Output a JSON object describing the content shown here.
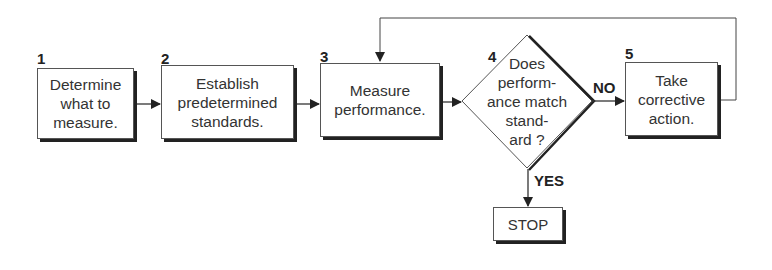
{
  "diagram": {
    "type": "flowchart",
    "steps": [
      {
        "number": "1",
        "text": "Determine what to measure.",
        "lines": [
          "Determine",
          "what to",
          "measure."
        ]
      },
      {
        "number": "2",
        "text": "Establish predetermined standards.",
        "lines": [
          "Establish",
          "predetermined",
          "standards."
        ]
      },
      {
        "number": "3",
        "text": "Measure performance.",
        "lines": [
          "Measure",
          "performance."
        ]
      },
      {
        "number": "4",
        "text": "Does performance match standard?",
        "lines": [
          "Does",
          "perform-",
          "ance match",
          "stand-",
          "ard ?"
        ]
      },
      {
        "number": "5",
        "text": "Take corrective action.",
        "lines": [
          "Take",
          "corrective",
          "action."
        ]
      }
    ],
    "terminal": {
      "text": "STOP"
    },
    "edge_labels": {
      "no": "NO",
      "yes": "YES"
    },
    "edges": [
      {
        "from": "1",
        "to": "2"
      },
      {
        "from": "2",
        "to": "3"
      },
      {
        "from": "3",
        "to": "4"
      },
      {
        "from": "4",
        "to": "5",
        "label": "NO"
      },
      {
        "from": "4",
        "to": "STOP",
        "label": "YES"
      },
      {
        "from": "5",
        "to": "3",
        "label": ""
      }
    ]
  }
}
